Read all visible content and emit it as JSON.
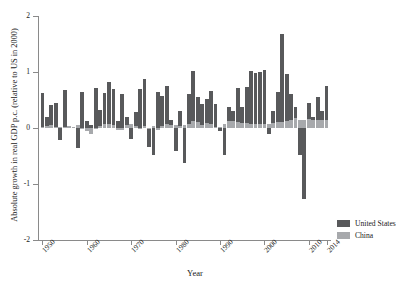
{
  "chart_data": {
    "type": "bar",
    "title": "",
    "xlabel": "Year",
    "ylabel": "Absolute growth in real GDP p.c. (relative to US in 2000)",
    "xlim": [
      1949,
      2015
    ],
    "ylim": [
      -2,
      2
    ],
    "yticks": [
      2,
      1,
      0,
      -1,
      -2
    ],
    "ytick_labels": [
      "2",
      "1",
      "0",
      "-1",
      "-2"
    ],
    "xticks": [
      1950,
      1960,
      1970,
      1980,
      1990,
      2000,
      2010,
      2014
    ],
    "xtick_labels": [
      "1950",
      "1960",
      "1970",
      "1980",
      "1990",
      "2000",
      "2010",
      "2014"
    ],
    "grid": false,
    "legend_position": "right-bottom",
    "colors": {
      "united_states": "#58595b",
      "china": "#a7a9ac"
    },
    "x": [
      1950,
      1951,
      1952,
      1953,
      1954,
      1955,
      1956,
      1957,
      1958,
      1959,
      1960,
      1961,
      1962,
      1963,
      1964,
      1965,
      1966,
      1967,
      1968,
      1969,
      1970,
      1971,
      1972,
      1973,
      1974,
      1975,
      1976,
      1977,
      1978,
      1979,
      1980,
      1981,
      1982,
      1983,
      1984,
      1985,
      1986,
      1987,
      1988,
      1989,
      1990,
      1991,
      1992,
      1993,
      1994,
      1995,
      1996,
      1997,
      1998,
      1999,
      2000,
      2001,
      2002,
      2003,
      2004,
      2005,
      2006,
      2007,
      2008,
      2009,
      2010,
      2011,
      2012,
      2013,
      2014
    ],
    "series": [
      {
        "name": "United States",
        "color": "#58595b",
        "values": [
          0.62,
          0.2,
          0.41,
          0.45,
          -0.21,
          0.68,
          0.03,
          0.02,
          -0.36,
          0.64,
          0.12,
          0.05,
          0.71,
          0.32,
          0.63,
          0.83,
          0.7,
          0.13,
          0.6,
          0.2,
          -0.2,
          0.28,
          0.7,
          0.88,
          -0.34,
          -0.48,
          0.65,
          0.57,
          0.75,
          0.15,
          -0.41,
          0.3,
          -0.62,
          0.61,
          1.01,
          0.55,
          0.42,
          0.52,
          0.66,
          0.42,
          -0.05,
          -0.48,
          0.38,
          0.3,
          0.71,
          0.38,
          0.74,
          1.02,
          0.98,
          1.0,
          1.04,
          -0.1,
          0.31,
          0.65,
          1.67,
          0.96,
          0.6,
          0.37,
          -0.48,
          -1.26,
          0.45,
          0.2,
          0.55,
          0.3,
          0.75
        ]
      },
      {
        "name": "China",
        "color": "#a7a9ac",
        "values": [
          0.02,
          0.03,
          0.05,
          0.02,
          0.01,
          0.02,
          0.03,
          0.02,
          0.05,
          -0.02,
          -0.06,
          -0.1,
          -0.02,
          0.04,
          0.07,
          0.07,
          0.05,
          -0.03,
          -0.03,
          0.05,
          0.07,
          0.03,
          0.0,
          0.04,
          0.0,
          0.04,
          -0.03,
          0.04,
          0.08,
          0.05,
          0.05,
          0.03,
          0.06,
          0.08,
          0.13,
          0.11,
          0.06,
          0.09,
          0.08,
          0.02,
          0.01,
          0.07,
          0.12,
          0.12,
          0.11,
          0.09,
          0.09,
          0.08,
          0.07,
          0.07,
          0.08,
          0.08,
          0.09,
          0.1,
          0.11,
          0.12,
          0.15,
          0.17,
          0.15,
          0.14,
          0.16,
          0.15,
          0.14,
          0.14,
          0.14
        ]
      }
    ],
    "legend": [
      {
        "label": "United States",
        "color": "#58595b"
      },
      {
        "label": "China",
        "color": "#a7a9ac"
      }
    ]
  }
}
